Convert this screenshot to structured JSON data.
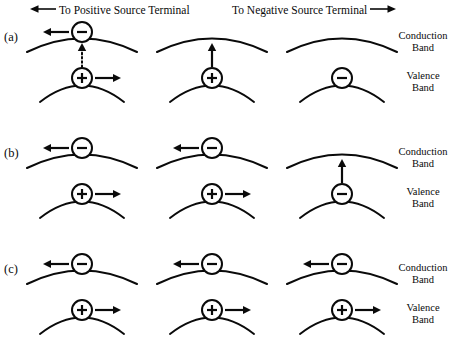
{
  "figure": {
    "width": 464,
    "height": 350,
    "stroke_color": "#0a0a0a",
    "background_color": "#ffffff"
  },
  "header": {
    "positive_terminal": {
      "text": "To Positive Source Terminal",
      "arrow_direction": "left",
      "arrow_icon": "long-arrow-left-icon"
    },
    "negative_terminal": {
      "text": "To Negative Source Terminal",
      "arrow_direction": "right",
      "arrow_icon": "long-arrow-right-icon"
    }
  },
  "band_labels": {
    "conduction_line1": "Conduction",
    "conduction_line2": "Band",
    "valence_line1": "Valence",
    "valence_line2": "Band"
  },
  "rows": [
    {
      "id": "a",
      "label": "(a)",
      "panels": [
        {
          "id": "a1",
          "conduction": {
            "carrier": "minus",
            "carrier_sign": "−",
            "arrow": "left"
          },
          "valence": {
            "carrier": "plus",
            "carrier_sign": "+",
            "arrow": "right"
          },
          "transition": {
            "type": "dotted",
            "direction": "up"
          }
        },
        {
          "id": "a2",
          "conduction": {
            "carrier": "none",
            "carrier_sign": "",
            "arrow": "none"
          },
          "valence": {
            "carrier": "plus",
            "carrier_sign": "+",
            "arrow": "none"
          },
          "transition": {
            "type": "solid",
            "direction": "up"
          }
        },
        {
          "id": "a3",
          "conduction": {
            "carrier": "none",
            "carrier_sign": "",
            "arrow": "none"
          },
          "valence": {
            "carrier": "minus",
            "carrier_sign": "−",
            "arrow": "none"
          },
          "transition": {
            "type": "none",
            "direction": "none"
          }
        }
      ]
    },
    {
      "id": "b",
      "label": "(b)",
      "panels": [
        {
          "id": "b1",
          "conduction": {
            "carrier": "minus",
            "carrier_sign": "−",
            "arrow": "left"
          },
          "valence": {
            "carrier": "plus",
            "carrier_sign": "+",
            "arrow": "right"
          },
          "transition": {
            "type": "none",
            "direction": "none"
          }
        },
        {
          "id": "b2",
          "conduction": {
            "carrier": "minus",
            "carrier_sign": "−",
            "arrow": "left"
          },
          "valence": {
            "carrier": "plus",
            "carrier_sign": "+",
            "arrow": "right"
          },
          "transition": {
            "type": "none",
            "direction": "none"
          }
        },
        {
          "id": "b3",
          "conduction": {
            "carrier": "none",
            "carrier_sign": "",
            "arrow": "none"
          },
          "valence": {
            "carrier": "minus",
            "carrier_sign": "−",
            "arrow": "none"
          },
          "transition": {
            "type": "solid",
            "direction": "up"
          }
        }
      ]
    },
    {
      "id": "c",
      "label": "(c)",
      "panels": [
        {
          "id": "c1",
          "conduction": {
            "carrier": "minus",
            "carrier_sign": "−",
            "arrow": "left"
          },
          "valence": {
            "carrier": "plus",
            "carrier_sign": "+",
            "arrow": "right"
          },
          "transition": {
            "type": "none",
            "direction": "none"
          }
        },
        {
          "id": "c2",
          "conduction": {
            "carrier": "minus",
            "carrier_sign": "−",
            "arrow": "left"
          },
          "valence": {
            "carrier": "plus",
            "carrier_sign": "+",
            "arrow": "right"
          },
          "transition": {
            "type": "none",
            "direction": "none"
          }
        },
        {
          "id": "c3",
          "conduction": {
            "carrier": "minus",
            "carrier_sign": "−",
            "arrow": "left"
          },
          "valence": {
            "carrier": "plus",
            "carrier_sign": "+",
            "arrow": "right"
          },
          "transition": {
            "type": "none",
            "direction": "none"
          }
        }
      ]
    }
  ],
  "layout": {
    "row_tops": [
      18,
      134,
      250
    ],
    "panel_lefts": [
      28,
      158,
      288
    ],
    "band_label_tops": {
      "conduction": [
        30,
        146,
        262
      ],
      "valence": [
        70,
        186,
        302
      ]
    }
  }
}
